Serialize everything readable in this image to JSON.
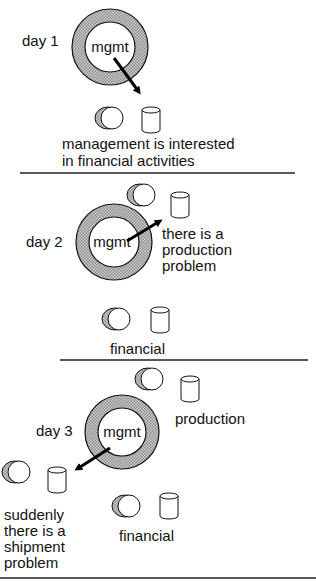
{
  "diagram": {
    "type": "process-evolution",
    "colors": {
      "ring_fill": "#a8a8a8",
      "stroke": "#111111",
      "background": "#ffffff"
    },
    "panels": [
      {
        "id": "day1",
        "day_label": "day 1",
        "center_label": "mgmt",
        "arrow_target": "financial",
        "entities": [
          {
            "id": "financial",
            "label": "",
            "icons": [
              "process-icon",
              "database-icon"
            ]
          }
        ],
        "caption": [
          "management is interested",
          "in financial activities"
        ]
      },
      {
        "id": "day2",
        "day_label": "day 2",
        "center_label": "mgmt",
        "arrow_target": "production",
        "entities": [
          {
            "id": "production",
            "label": "",
            "icons": [
              "process-icon",
              "database-icon"
            ]
          },
          {
            "id": "financial",
            "label": "financial",
            "icons": [
              "process-icon",
              "database-icon"
            ]
          }
        ],
        "caption": [
          "there is a",
          "production",
          "problem"
        ]
      },
      {
        "id": "day3",
        "day_label": "day 3",
        "center_label": "mgmt",
        "arrow_target": "shipment",
        "entities": [
          {
            "id": "production",
            "label": "production",
            "icons": [
              "process-icon",
              "database-icon"
            ]
          },
          {
            "id": "shipment",
            "label": "",
            "icons": [
              "process-icon",
              "database-icon"
            ]
          },
          {
            "id": "financial",
            "label": "financial",
            "icons": [
              "process-icon",
              "database-icon"
            ]
          }
        ],
        "caption": [
          "suddenly",
          "there is a",
          "shipment",
          "problem"
        ]
      }
    ]
  }
}
